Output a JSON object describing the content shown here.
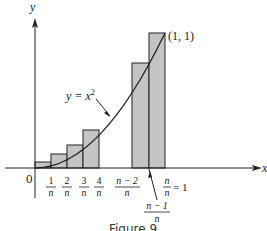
{
  "figure": {
    "caption": "Figure 9",
    "y_axis_label": "y",
    "x_axis_label": "x",
    "origin_label": "0",
    "curve_label": "y = x",
    "curve_exponent": "2",
    "point_label": "(1, 1)",
    "tick_labels": [
      {
        "num": "1",
        "den": "n"
      },
      {
        "num": "2",
        "den": "n"
      },
      {
        "num": "3",
        "den": "n"
      },
      {
        "num": "4",
        "den": "n"
      },
      {
        "num": "n − 2",
        "den": "n"
      },
      {
        "num": "n − 1",
        "den": "n"
      },
      {
        "num": "n",
        "den": "n",
        "suffix": "= 1"
      }
    ],
    "colors": {
      "bar_fill": "#c4c4c4",
      "stroke": "#222222"
    }
  }
}
